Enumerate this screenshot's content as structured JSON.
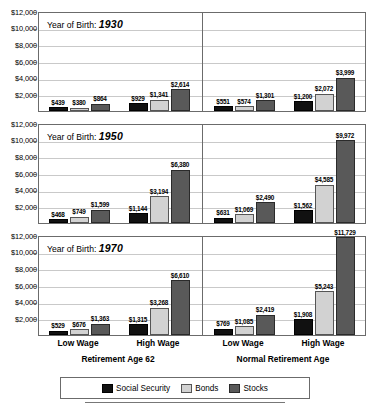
{
  "chart_data": {
    "type": "bar",
    "title": "",
    "xlabel": "",
    "ylabel": "",
    "ylim": [
      0,
      12000
    ],
    "grid": true,
    "legend_position": "bottom",
    "ytick_labels": [
      "$12,000",
      "$10,000",
      "$8,000",
      "$6,000",
      "$4,000",
      "$2,000"
    ],
    "yticks": [
      12000,
      10000,
      8000,
      6000,
      4000,
      2000
    ],
    "legend": [
      "Social Security",
      "Bonds",
      "Stocks"
    ],
    "series_colors": [
      "#111111",
      "#d2d2d2",
      "#595959"
    ],
    "group_labels": [
      "Retirement Age 62",
      "Normal Retirement Age"
    ],
    "categories": [
      "Low Wage",
      "High Wage",
      "Low Wage",
      "High Wage"
    ],
    "panel_label_prefix": "Year of Birth:",
    "panels": [
      {
        "year": "1930",
        "clusters": [
          {
            "group": "Retirement Age 62",
            "wage": "Low Wage",
            "values": [
              439,
              380,
              864
            ],
            "labels": [
              "$439",
              "$380",
              "$864"
            ]
          },
          {
            "group": "Retirement Age 62",
            "wage": "High Wage",
            "values": [
              929,
              1341,
              2614
            ],
            "labels": [
              "$929",
              "$1,341",
              "$2,614"
            ]
          },
          {
            "group": "Normal Retirement Age",
            "wage": "Low Wage",
            "values": [
              551,
              574,
              1301
            ],
            "labels": [
              "$551",
              "$574",
              "$1,301"
            ]
          },
          {
            "group": "Normal Retirement Age",
            "wage": "High Wage",
            "values": [
              1200,
              2072,
              3999
            ],
            "labels": [
              "$1,200",
              "$2,072",
              "$3,999"
            ]
          }
        ]
      },
      {
        "year": "1950",
        "clusters": [
          {
            "group": "Retirement Age 62",
            "wage": "Low Wage",
            "values": [
              468,
              749,
              1599
            ],
            "labels": [
              "$468",
              "$749",
              "$1,599"
            ]
          },
          {
            "group": "Retirement Age 62",
            "wage": "High Wage",
            "values": [
              1144,
              3194,
              6380
            ],
            "labels": [
              "$1,144",
              "$3,194",
              "$6,380"
            ]
          },
          {
            "group": "Normal Retirement Age",
            "wage": "Low Wage",
            "values": [
              631,
              1069,
              2490
            ],
            "labels": [
              "$631",
              "$1,069",
              "$2,490"
            ]
          },
          {
            "group": "Normal Retirement Age",
            "wage": "High Wage",
            "values": [
              1562,
              4585,
              9972
            ],
            "labels": [
              "$1,562",
              "$4,585",
              "$9,972"
            ]
          }
        ]
      },
      {
        "year": "1970",
        "clusters": [
          {
            "group": "Retirement Age 62",
            "wage": "Low Wage",
            "values": [
              529,
              676,
              1363
            ],
            "labels": [
              "$529",
              "$676",
              "$1,363"
            ]
          },
          {
            "group": "Retirement Age 62",
            "wage": "High Wage",
            "values": [
              1315,
              3268,
              6610
            ],
            "labels": [
              "$1,315",
              "$3,268",
              "$6,610"
            ]
          },
          {
            "group": "Normal Retirement Age",
            "wage": "Low Wage",
            "values": [
              769,
              1085,
              2419
            ],
            "labels": [
              "$769",
              "$1,085",
              "$2,419"
            ]
          },
          {
            "group": "Normal Retirement Age",
            "wage": "High Wage",
            "values": [
              1908,
              5243,
              11729
            ],
            "labels": [
              "$1,908",
              "$5,243",
              "$11,729"
            ]
          }
        ]
      }
    ]
  }
}
